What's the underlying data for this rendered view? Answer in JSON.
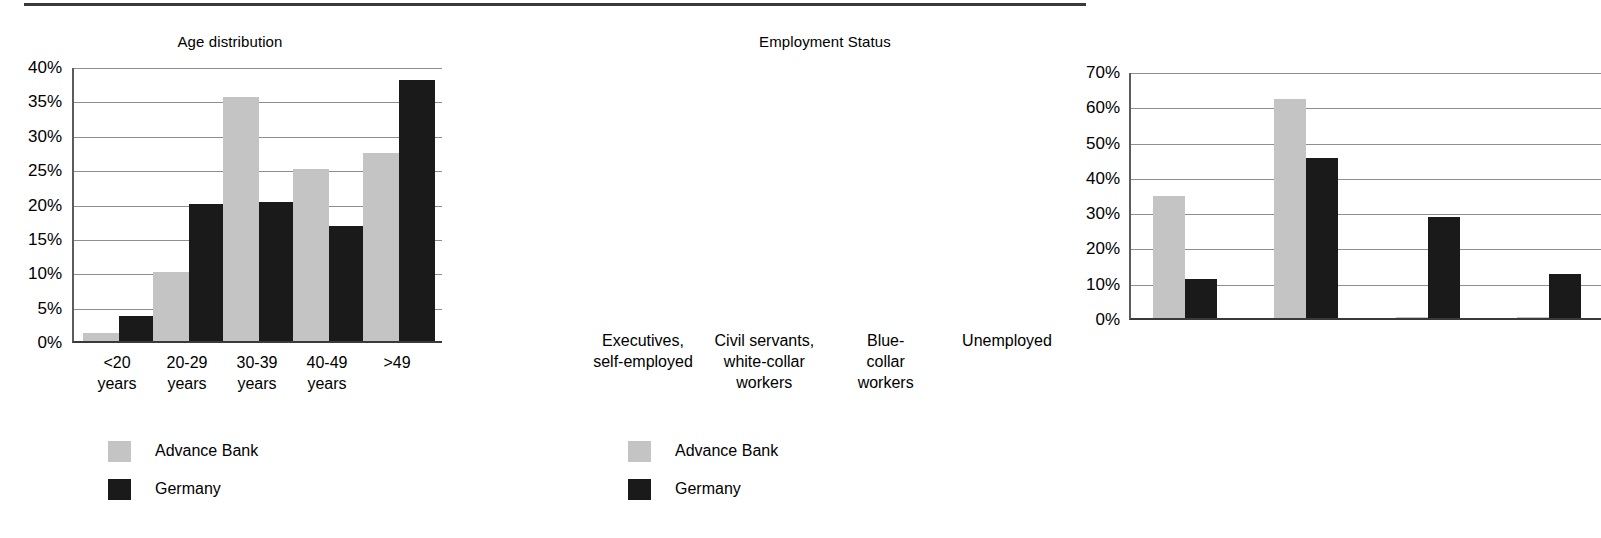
{
  "page": {
    "background": "#ffffff",
    "rule_color": "#3a3a3a"
  },
  "colors": {
    "advance_bank": "#c4c4c4",
    "germany": "#1a1a1a",
    "gridline": "#8e8e8e",
    "axis": "#3a3a3a"
  },
  "legend": {
    "advance_label": "Advance Bank",
    "germany_label": "Germany"
  },
  "chart_data": [
    {
      "id": "age-distribution",
      "type": "bar",
      "title": "Age distribution",
      "xlabel": "",
      "ylabel": "",
      "ylim": [
        0,
        40
      ],
      "grid": true,
      "legend_position": "below-left",
      "ytick_labels": [
        "40%",
        "35%",
        "30%",
        "25%",
        "20%",
        "15%",
        "10%",
        "5%",
        "0%"
      ],
      "ytick_values": [
        40,
        35,
        30,
        25,
        20,
        15,
        10,
        5,
        0
      ],
      "categories": [
        "<20\nyears",
        "20-29\nyears",
        "30-39\nyears",
        "40-49\nyears",
        ">49"
      ],
      "series": [
        {
          "name": "Advance Bank",
          "color": "#c4c4c4",
          "values": [
            1.2,
            10.0,
            35.5,
            25.0,
            27.3
          ]
        },
        {
          "name": "Germany",
          "color": "#1a1a1a",
          "values": [
            3.6,
            20.0,
            20.2,
            16.8,
            38.0
          ]
        }
      ]
    },
    {
      "id": "employment-status",
      "type": "bar",
      "title": "Employment Status",
      "xlabel": "",
      "ylabel": "",
      "ylim": [
        0,
        70
      ],
      "grid": true,
      "legend_position": "below-left",
      "ytick_labels": [
        "70%",
        "60%",
        "50%",
        "40%",
        "30%",
        "20%",
        "10%",
        "0%"
      ],
      "ytick_values": [
        70,
        60,
        50,
        40,
        30,
        20,
        10,
        0
      ],
      "categories": [
        "Executives,\nself-employed",
        "Civil servants,\nwhite-collar\nworkers",
        "Blue-\ncollar\nworkers",
        "Unemployed"
      ],
      "series": [
        {
          "name": "Advance Bank",
          "color": "#c4c4c4",
          "values": [
            34.6,
            62.2,
            0.4,
            0.3
          ]
        },
        {
          "name": "Germany",
          "color": "#1a1a1a",
          "values": [
            11.0,
            45.4,
            28.7,
            12.6
          ]
        }
      ]
    }
  ]
}
